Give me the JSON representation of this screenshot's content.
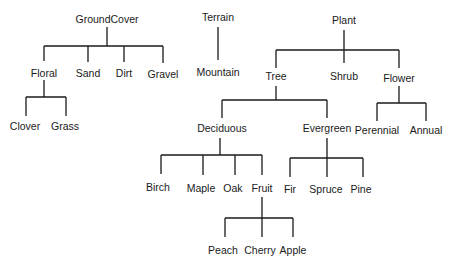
{
  "diagram": {
    "type": "tree-forest",
    "colors": {
      "line": "#1a1a1a",
      "text": "#1a1a1a",
      "background": "#ffffff"
    },
    "nodes": [
      {
        "id": "groundcover",
        "label": "GroundCover",
        "x": 107,
        "y": 19
      },
      {
        "id": "floral",
        "label": "Floral",
        "x": 44,
        "y": 73
      },
      {
        "id": "sand",
        "label": "Sand",
        "x": 88,
        "y": 73
      },
      {
        "id": "dirt",
        "label": "Dirt",
        "x": 124,
        "y": 73
      },
      {
        "id": "gravel",
        "label": "Gravel",
        "x": 163,
        "y": 74
      },
      {
        "id": "clover",
        "label": "Clover",
        "x": 25,
        "y": 126
      },
      {
        "id": "grass",
        "label": "Grass",
        "x": 65,
        "y": 126
      },
      {
        "id": "terrain",
        "label": "Terrain",
        "x": 218,
        "y": 17
      },
      {
        "id": "mountain",
        "label": "Mountain",
        "x": 218,
        "y": 72
      },
      {
        "id": "plant",
        "label": "Plant",
        "x": 344,
        "y": 20
      },
      {
        "id": "tree",
        "label": "Tree",
        "x": 276,
        "y": 76
      },
      {
        "id": "shrub",
        "label": "Shrub",
        "x": 344,
        "y": 76
      },
      {
        "id": "flower",
        "label": "Flower",
        "x": 399,
        "y": 78
      },
      {
        "id": "deciduous",
        "label": "Deciduous",
        "x": 222,
        "y": 128
      },
      {
        "id": "evergreen",
        "label": "Evergreen",
        "x": 327,
        "y": 128
      },
      {
        "id": "perennial",
        "label": "Perennial",
        "x": 377,
        "y": 130
      },
      {
        "id": "annual",
        "label": "Annual",
        "x": 426,
        "y": 130
      },
      {
        "id": "birch",
        "label": "Birch",
        "x": 158,
        "y": 187
      },
      {
        "id": "maple",
        "label": "Maple",
        "x": 201,
        "y": 188
      },
      {
        "id": "oak",
        "label": "Oak",
        "x": 233,
        "y": 188
      },
      {
        "id": "fruit",
        "label": "Fruit",
        "x": 262,
        "y": 188
      },
      {
        "id": "fir",
        "label": "Fir",
        "x": 290,
        "y": 189
      },
      {
        "id": "spruce",
        "label": "Spruce",
        "x": 326,
        "y": 189
      },
      {
        "id": "pine",
        "label": "Pine",
        "x": 361,
        "y": 189
      },
      {
        "id": "peach",
        "label": "Peach",
        "x": 223,
        "y": 250
      },
      {
        "id": "cherry",
        "label": "Cherry",
        "x": 260,
        "y": 250
      },
      {
        "id": "apple",
        "label": "Apple",
        "x": 293,
        "y": 250
      }
    ],
    "edges": [
      {
        "parent": "groundcover",
        "children": [
          "floral",
          "sand",
          "dirt",
          "gravel"
        ]
      },
      {
        "parent": "floral",
        "children": [
          "clover",
          "grass"
        ]
      },
      {
        "parent": "terrain",
        "children": [
          "mountain"
        ]
      },
      {
        "parent": "plant",
        "children": [
          "tree",
          "shrub",
          "flower"
        ]
      },
      {
        "parent": "tree",
        "children": [
          "deciduous",
          "evergreen"
        ]
      },
      {
        "parent": "flower",
        "children": [
          "perennial",
          "annual"
        ]
      },
      {
        "parent": "deciduous",
        "children": [
          "birch",
          "maple",
          "oak",
          "fruit"
        ]
      },
      {
        "parent": "evergreen",
        "children": [
          "fir",
          "spruce",
          "pine"
        ]
      },
      {
        "parent": "fruit",
        "children": [
          "peach",
          "cherry",
          "apple"
        ]
      }
    ],
    "connectors": [
      {
        "parent": "groundcover",
        "stem": [
          107,
          27,
          46
        ],
        "bar": [
          44,
          163,
          46
        ],
        "drops": [
          [
            44,
            61
          ],
          [
            88,
            62
          ],
          [
            124,
            62
          ],
          [
            163,
            63
          ]
        ]
      },
      {
        "parent": "floral",
        "stem": [
          44,
          80,
          97
        ],
        "bar": [
          26,
          66,
          97
        ],
        "drops": [
          [
            26,
            116
          ],
          [
            66,
            116
          ]
        ]
      },
      {
        "parent": "terrain",
        "stem": [
          218,
          27,
          60
        ],
        "bar": null,
        "drops": []
      },
      {
        "parent": "plant",
        "stem": [
          344,
          30,
          50
        ],
        "bar": [
          276,
          399,
          50
        ],
        "drops": [
          [
            276,
            68
          ],
          [
            344,
            63
          ],
          [
            399,
            68
          ]
        ]
      },
      {
        "parent": "tree",
        "stem": [
          276,
          86,
          100
        ],
        "bar": [
          222,
          327,
          100
        ],
        "drops": [
          [
            222,
            118
          ],
          [
            327,
            118
          ]
        ]
      },
      {
        "parent": "flower",
        "stem": [
          399,
          86,
          103
        ],
        "bar": [
          377,
          426,
          103
        ],
        "drops": [
          [
            377,
            121
          ],
          [
            426,
            121
          ]
        ]
      },
      {
        "parent": "deciduous",
        "stem": [
          220,
          138,
          155
        ],
        "bar": [
          161,
          262,
          155
        ],
        "drops": [
          [
            161,
            174
          ],
          [
            203,
            175
          ],
          [
            235,
            175
          ],
          [
            262,
            175
          ]
        ]
      },
      {
        "parent": "evergreen",
        "stem": [
          327,
          138,
          158
        ],
        "bar": [
          290,
          363,
          158
        ],
        "drops": [
          [
            290,
            177
          ],
          [
            327,
            177
          ],
          [
            363,
            177
          ]
        ]
      },
      {
        "parent": "fruit",
        "stem": [
          262,
          197,
          218
        ],
        "bar": [
          225,
          293,
          218
        ],
        "drops": [
          [
            225,
            237
          ],
          [
            262,
            237
          ],
          [
            293,
            237
          ]
        ]
      }
    ]
  }
}
